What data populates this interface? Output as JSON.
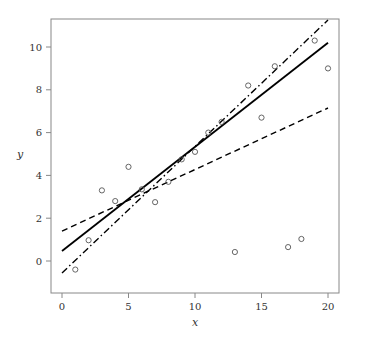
{
  "chart_data": {
    "type": "scatter",
    "title": "",
    "xlabel": "x",
    "ylabel": "y",
    "xlim": [
      -0.8,
      20.8
    ],
    "ylim": [
      -1.5,
      11.3
    ],
    "grid": false,
    "legend": null,
    "x_ticks": [
      0,
      5,
      10,
      15,
      20
    ],
    "y_ticks": [
      0,
      2,
      4,
      6,
      8,
      10
    ],
    "points": {
      "x": [
        1,
        2,
        3,
        4,
        5,
        6,
        7,
        8,
        9,
        10,
        11,
        12,
        13,
        14,
        15,
        16,
        17,
        18,
        19,
        20
      ],
      "y": [
        -0.4,
        0.97,
        3.3,
        2.8,
        4.4,
        3.35,
        2.75,
        3.7,
        4.75,
        5.1,
        6.0,
        6.5,
        0.42,
        8.2,
        6.7,
        9.1,
        0.65,
        1.03,
        10.3,
        9.0
      ],
      "marker": "open-circle"
    },
    "series": [
      {
        "name": "fit-solid",
        "style": "solid",
        "x": [
          0,
          20
        ],
        "y": [
          0.47,
          10.2
        ]
      },
      {
        "name": "fit-dashed",
        "style": "dashed",
        "x": [
          0,
          20
        ],
        "y": [
          1.4,
          7.15
        ]
      },
      {
        "name": "fit-dashdot",
        "style": "dashdot",
        "x": [
          0,
          20
        ],
        "y": [
          -0.56,
          11.26
        ]
      }
    ]
  }
}
